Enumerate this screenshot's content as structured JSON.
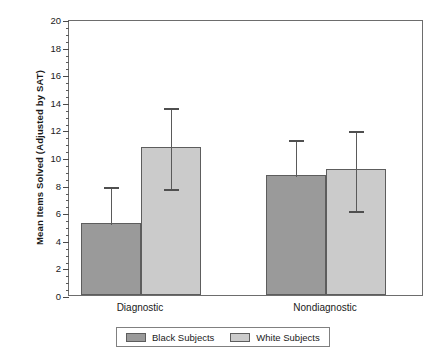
{
  "chart_data": {
    "type": "bar",
    "title": "",
    "xlabel": "",
    "ylabel": "Mean Items Solved (Adjusted by SAT)",
    "categories": [
      "Diagnostic",
      "Nondiagnostic"
    ],
    "series": [
      {
        "name": "Black Subjects",
        "color": "#9a9a9a",
        "values": [
          5.2,
          8.7
        ],
        "error_high": [
          8.0,
          11.4
        ],
        "error_low": [
          5.2,
          8.7
        ]
      },
      {
        "name": "White Subjects",
        "color": "#cbcbcb",
        "values": [
          10.7,
          9.1
        ],
        "error_high": [
          13.7,
          12.0
        ],
        "error_low": [
          7.8,
          6.2
        ]
      }
    ],
    "ylim": [
      0,
      20
    ],
    "yticks": [
      0,
      2,
      4,
      6,
      8,
      10,
      12,
      14,
      16,
      18,
      20
    ],
    "ytick_labels": [
      "0",
      "2",
      "4",
      "6",
      "8",
      "10",
      "12",
      "14",
      "16",
      "18",
      "20"
    ],
    "yminor_step": 0.5,
    "grid": false,
    "legend_position": "bottom",
    "legend_entries": [
      "Black Subjects",
      "White Subjects"
    ]
  },
  "axis": {
    "y_title": "Mean Items Solved (Adjusted by SAT)"
  },
  "legend": {
    "items": [
      {
        "label": "Black Subjects"
      },
      {
        "label": "White Subjects"
      }
    ]
  }
}
